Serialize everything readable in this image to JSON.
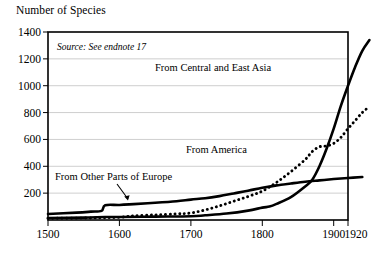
{
  "chart_title": "Number of Species",
  "source_note": "Source: See endnote 17",
  "axes": {
    "y_ticks": [
      "200",
      "400",
      "600",
      "800",
      "1000",
      "1200",
      "1400"
    ],
    "x_ticks": [
      "1500",
      "1600",
      "1700",
      "1800",
      "1900",
      "1920"
    ],
    "ylabel": "Number of Species",
    "xlabel": ""
  },
  "labels": {
    "asia": "From Central and East Asia",
    "america": "From America",
    "europe": "From Other Parts of Europe"
  },
  "chart_data": {
    "type": "line",
    "title": "Number of Species",
    "xlabel": "",
    "ylabel": "Number of Species",
    "xlim": [
      1500,
      1920
    ],
    "ylim": [
      0,
      1400
    ],
    "grid": true,
    "legend": "inline-annotations",
    "annotations": [
      {
        "text": "Source: See endnote 17",
        "x": 1530,
        "y": 1300
      },
      {
        "text": "From Central and East Asia",
        "x": 1690,
        "y": 1090
      },
      {
        "text": "From America",
        "x": 1720,
        "y": 545
      },
      {
        "text": "From Other Parts of Europe",
        "x": 1510,
        "y": 390,
        "arrow_to": {
          "x": 1608,
          "y": 120
        }
      }
    ],
    "series": [
      {
        "name": "From Central and East Asia",
        "style": "solid",
        "color": "#000000",
        "points": [
          [
            1500,
            15
          ],
          [
            1550,
            18
          ],
          [
            1580,
            22
          ],
          [
            1600,
            22
          ],
          [
            1650,
            25
          ],
          [
            1700,
            28
          ],
          [
            1720,
            35
          ],
          [
            1750,
            48
          ],
          [
            1780,
            70
          ],
          [
            1800,
            92
          ],
          [
            1810,
            100
          ],
          [
            1820,
            120
          ],
          [
            1840,
            170
          ],
          [
            1860,
            250
          ],
          [
            1870,
            300
          ],
          [
            1880,
            400
          ],
          [
            1890,
            530
          ],
          [
            1900,
            680
          ],
          [
            1910,
            850
          ],
          [
            1920,
            1000
          ],
          [
            1930,
            1140
          ],
          [
            1940,
            1260
          ],
          [
            1950,
            1340
          ]
        ]
      },
      {
        "name": "From America",
        "style": "dotted",
        "color": "#000000",
        "points": [
          [
            1500,
            12
          ],
          [
            1560,
            15
          ],
          [
            1600,
            20
          ],
          [
            1620,
            30
          ],
          [
            1650,
            38
          ],
          [
            1680,
            45
          ],
          [
            1700,
            52
          ],
          [
            1720,
            75
          ],
          [
            1740,
            105
          ],
          [
            1760,
            140
          ],
          [
            1780,
            175
          ],
          [
            1800,
            215
          ],
          [
            1820,
            280
          ],
          [
            1840,
            360
          ],
          [
            1860,
            450
          ],
          [
            1870,
            510
          ],
          [
            1880,
            545
          ],
          [
            1890,
            552
          ],
          [
            1900,
            570
          ],
          [
            1910,
            615
          ],
          [
            1920,
            680
          ],
          [
            1930,
            740
          ],
          [
            1940,
            800
          ],
          [
            1950,
            845
          ]
        ]
      },
      {
        "name": "From Other Parts of Europe",
        "style": "solid",
        "color": "#000000",
        "points": [
          [
            1500,
            45
          ],
          [
            1540,
            55
          ],
          [
            1560,
            62
          ],
          [
            1575,
            68
          ],
          [
            1580,
            110
          ],
          [
            1600,
            112
          ],
          [
            1620,
            118
          ],
          [
            1650,
            128
          ],
          [
            1680,
            140
          ],
          [
            1700,
            152
          ],
          [
            1720,
            162
          ],
          [
            1740,
            178
          ],
          [
            1760,
            198
          ],
          [
            1780,
            218
          ],
          [
            1800,
            240
          ],
          [
            1820,
            258
          ],
          [
            1840,
            272
          ],
          [
            1860,
            285
          ],
          [
            1880,
            295
          ],
          [
            1900,
            305
          ],
          [
            1920,
            313
          ],
          [
            1940,
            320
          ]
        ]
      }
    ]
  }
}
